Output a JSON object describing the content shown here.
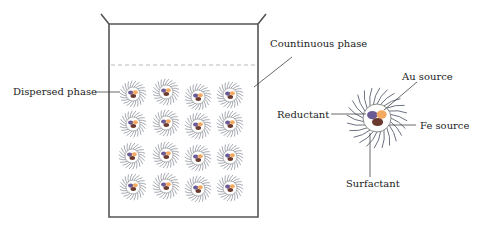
{
  "labels": {
    "dispersed_phase": "Dispersed phase",
    "continuous_phase": "Countinuous phase",
    "au_source": "Au source",
    "reductant": "Reductant",
    "fe_source": "Fe source",
    "surfactant": "Surfactant"
  },
  "colors": {
    "beaker_line": "#555555",
    "tail": "#6b7280",
    "reductant": "#6b5b95",
    "au_source": "#f4a960",
    "fe_source": "#6b3a2e"
  },
  "grid": {
    "rows": 4,
    "cols": 4
  }
}
